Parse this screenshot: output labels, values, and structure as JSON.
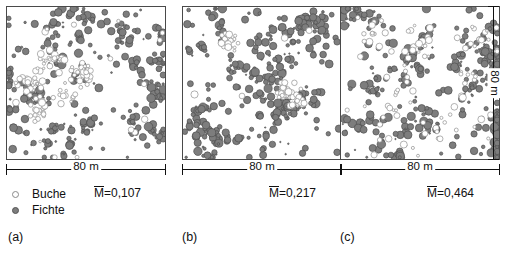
{
  "figure": {
    "scale_label_horizontal": "80 m",
    "scale_label_vertical": "80 m",
    "legend": [
      {
        "label": "Buche",
        "marker": "open-circle",
        "species": "beech",
        "color": "#ffffff",
        "outline": "#8a8a8a"
      },
      {
        "label": "Fichte",
        "marker": "filled-circle",
        "species": "spruce",
        "color": "#7d7d7d",
        "outline": "#555555"
      }
    ],
    "panels": [
      {
        "id": "a",
        "caption": "(a)",
        "m_symbol": "M",
        "m_text": "=0,107",
        "m_value": 0.107
      },
      {
        "id": "b",
        "caption": "(b)",
        "m_symbol": "M",
        "m_text": "=0,217",
        "m_value": 0.217
      },
      {
        "id": "c",
        "caption": "(c)",
        "m_symbol": "M",
        "m_text": "=0,464",
        "m_value": 0.464
      }
    ]
  },
  "chart_data": {
    "type": "scatter",
    "title": "",
    "xlabel": "80 m",
    "ylabel": "80 m",
    "xlim": [
      0,
      80
    ],
    "ylim": [
      0,
      80
    ],
    "grid": false,
    "legend_position": "below-left",
    "annotations": [
      "M̄=0,107",
      "M̄=0,217",
      "M̄=0,464"
    ],
    "series": [
      {
        "name": "Buche",
        "marker": "open-circle",
        "color": "#ffffff"
      },
      {
        "name": "Fichte",
        "marker": "filled-circle",
        "color": "#7d7d7d"
      }
    ],
    "panels": [
      {
        "id": "a",
        "caption": "(a)",
        "mingling_index": 0.107,
        "description": "Beech concentrated in left-central band, spruce spread across whole plot; low species intermingling.",
        "counts": {
          "Buche": 118,
          "Fichte": 292
        },
        "beech_cluster_centers_m": [
          [
            12,
            40
          ],
          [
            22,
            52
          ],
          [
            30,
            34
          ],
          [
            18,
            26
          ],
          [
            38,
            44
          ]
        ],
        "spruce_distribution": "near-uniform with small local groups"
      },
      {
        "id": "b",
        "caption": "(b)",
        "mingling_index": 0.217,
        "description": "Spruce dominant throughout; two compact beech groups, one upper-left, one centre-right.",
        "counts": {
          "Buche": 74,
          "Fichte": 338
        },
        "beech_cluster_centers_m": [
          [
            24,
            62
          ],
          [
            52,
            36
          ],
          [
            58,
            30
          ]
        ],
        "spruce_distribution": "dense, clumped in diagonal bands"
      },
      {
        "id": "c",
        "caption": "(c)",
        "mingling_index": 0.464,
        "description": "Beech well mixed among spruce across the whole plot; highest intermingling of the three plots.",
        "counts": {
          "Buche": 96,
          "Fichte": 310
        },
        "beech_cluster_centers_m": [
          [
            16,
            66
          ],
          [
            40,
            58
          ],
          [
            62,
            44
          ],
          [
            28,
            30
          ],
          [
            52,
            14
          ],
          [
            70,
            62
          ]
        ],
        "spruce_distribution": "dense and evenly scattered"
      }
    ]
  }
}
